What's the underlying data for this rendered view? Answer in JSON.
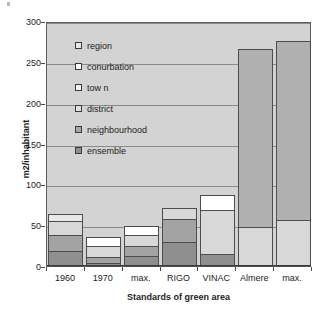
{
  "chart_data": {
    "type": "bar",
    "subtype": "stacked-bar",
    "title": "",
    "xlabel": "Standards of green area",
    "ylabel": "m2/inhabitant",
    "ylim": [
      0,
      300
    ],
    "ytick_step": 50,
    "ytick_labels": [
      "0",
      "50",
      "100",
      "150",
      "200",
      "250",
      "300"
    ],
    "grid": true,
    "legend_position": "inside-top-left",
    "categories": [
      "1960",
      "1970",
      "max.",
      "RIGO",
      "VINAC",
      "Almere",
      "max."
    ],
    "series": [
      {
        "name": "ensemble",
        "color": "#8f8f8f",
        "values": [
          20,
          5,
          13,
          31,
          16,
          0,
          0
        ]
      },
      {
        "name": "neighbourhood",
        "color": "#a3a3a3",
        "values": [
          20,
          8,
          14,
          29,
          0,
          0,
          0
        ]
      },
      {
        "name": "district",
        "color": "#d8d8d8",
        "values": [
          19,
          15,
          15,
          15,
          55,
          49,
          58
        ]
      },
      {
        "name": "tow n",
        "color": "#e8e8e8",
        "values": [
          9,
          0,
          0,
          0,
          0,
          0,
          0
        ]
      },
      {
        "name": "conurbation",
        "color": "#ffffff",
        "values": [
          0,
          13,
          12,
          0,
          20,
          0,
          0
        ]
      },
      {
        "name": "region",
        "color": "#b0b0b0",
        "values": [
          0,
          0,
          0,
          0,
          0,
          219,
          220
        ]
      }
    ],
    "totals": [
      68,
      41,
      54,
      75,
      91,
      268,
      278
    ]
  },
  "legend": {
    "items": [
      {
        "label": "region",
        "color": "#e8e8e8"
      },
      {
        "label": "conurbation",
        "color": "#ffffff"
      },
      {
        "label": "tow n",
        "color": "#f2f2f2"
      },
      {
        "label": "district",
        "color": "#e0e0e0"
      },
      {
        "label": "neighbourhood",
        "color": "#a8a8a8"
      },
      {
        "label": "ensemble",
        "color": "#8f8f8f"
      }
    ]
  },
  "style": {
    "plot_background": "#d3d3d3",
    "gridline_color": "#8a8a8a",
    "axis_color": "#3c3c3c",
    "text_color": "#1d1d1d"
  }
}
